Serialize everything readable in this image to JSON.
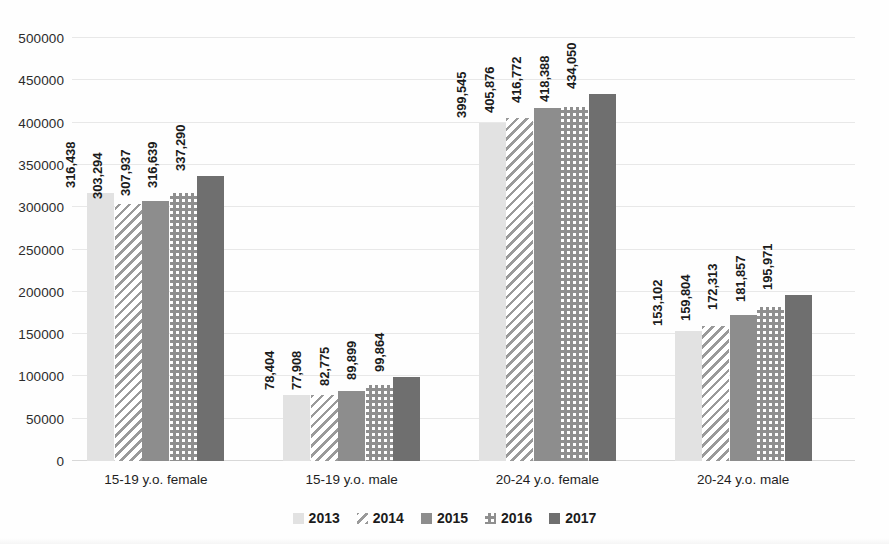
{
  "chart_data": {
    "type": "bar",
    "title": "",
    "subtitle": "",
    "xlabel": "",
    "ylabel": "",
    "ylim": [
      0,
      500000
    ],
    "ytick_labels": [
      "0",
      "50000",
      "100000",
      "150000",
      "200000",
      "250000",
      "300000",
      "350000",
      "400000",
      "450000",
      "500000"
    ],
    "ytick_values": [
      0,
      50000,
      100000,
      150000,
      200000,
      250000,
      300000,
      350000,
      400000,
      450000,
      500000
    ],
    "grid": true,
    "legend_position": "bottom",
    "categories": [
      "15-19 y.o. female",
      "15-19 y.o. male",
      "20-24 y.o. female",
      "20-24 y.o. male"
    ],
    "series": [
      {
        "name": "2013",
        "pattern": "solid-light",
        "color": "#e2e2e2",
        "values": [
          316438,
          78404,
          399545,
          153102
        ],
        "labels": [
          "316,438",
          "78,404",
          "399,545",
          "153,102"
        ]
      },
      {
        "name": "2014",
        "pattern": "diagonal-hatch",
        "color": "#9a9a9a",
        "values": [
          303294,
          77908,
          405876,
          159804
        ],
        "labels": [
          "303,294",
          "77,908",
          "405,876",
          "159,804"
        ]
      },
      {
        "name": "2015",
        "pattern": "solid-medium",
        "color": "#8d8d8d",
        "values": [
          307937,
          82775,
          416772,
          172313
        ],
        "labels": [
          "307,937",
          "82,775",
          "416,772",
          "172,313"
        ]
      },
      {
        "name": "2016",
        "pattern": "checkerboard",
        "color": "#8f8f8f",
        "values": [
          316639,
          89899,
          418388,
          181857
        ],
        "labels": [
          "316,639",
          "89,899",
          "418,388",
          "181,857"
        ]
      },
      {
        "name": "2017",
        "pattern": "solid-dark",
        "color": "#6f6f6f",
        "values": [
          337290,
          99864,
          434050,
          195971
        ],
        "labels": [
          "337,290",
          "99,864",
          "434,050",
          "195,971"
        ]
      }
    ]
  },
  "legend": {
    "items": [
      {
        "label": "2013"
      },
      {
        "label": "2014"
      },
      {
        "label": "2015"
      },
      {
        "label": "2016"
      },
      {
        "label": "2017"
      }
    ]
  }
}
